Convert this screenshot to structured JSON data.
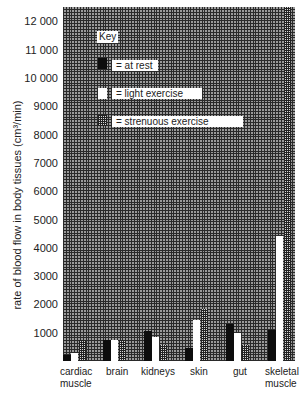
{
  "chart_data": {
    "type": "bar",
    "title": "",
    "xlabel": "",
    "ylabel": "rate of blood flow in body tissues (cm³/min)",
    "ylim": [
      0,
      12500
    ],
    "yticks": [
      1000,
      2000,
      3000,
      4000,
      5000,
      6000,
      7000,
      8000,
      9000,
      10000,
      11000,
      12000
    ],
    "ytick_labels": [
      "1000",
      "2000",
      "3000",
      "4000",
      "5000",
      "6000",
      "7000",
      "8000",
      "9000",
      "10 000",
      "11 000",
      "12 000"
    ],
    "grid": true,
    "legend_position": "upper-left (inside plot)",
    "legend_title": "Key",
    "categories": [
      "cardiac muscle",
      "brain",
      "kidneys",
      "skin",
      "gut",
      "skeletal muscle"
    ],
    "category_labels": [
      [
        "cardiac",
        "muscle"
      ],
      [
        "brain"
      ],
      [
        "kidneys"
      ],
      [
        "skin"
      ],
      [
        "gut"
      ],
      [
        "skeletal",
        "muscle"
      ]
    ],
    "series": [
      {
        "name": "at rest",
        "key_label": "= at rest",
        "style": "black",
        "values": [
          200,
          750,
          1050,
          450,
          1300,
          1100
        ]
      },
      {
        "name": "light exercise",
        "key_label": "= light exercise",
        "style": "white",
        "values": [
          300,
          750,
          850,
          1450,
          1000,
          4400
        ]
      },
      {
        "name": "strenuous exercise",
        "key_label": "= strenuous exercise",
        "style": "dotted-grey",
        "values": [
          750,
          750,
          550,
          1850,
          550,
          12500
        ]
      }
    ]
  },
  "colors": {
    "at_rest": "#0d0d0d",
    "light_exercise": "#ffffff",
    "strenuous_exercise": "#6e6e6e",
    "grid_background": "#9a9a9a"
  }
}
